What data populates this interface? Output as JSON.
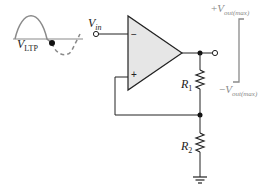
{
  "labels": {
    "vltp": {
      "main": "V",
      "sub": "LTP"
    },
    "vin": {
      "main": "V",
      "sub": "in"
    },
    "r1": {
      "main": "R",
      "sub": "1"
    },
    "r2": {
      "main": "R",
      "sub": "2"
    },
    "vout_max_pos": {
      "sign": "+",
      "main": "V",
      "sub": "out(max)"
    },
    "vout_max_neg": {
      "sign": "−",
      "main": "V",
      "sub": "out(max)"
    }
  },
  "opamp": {
    "inverting": "−",
    "noninverting": "+"
  },
  "colors": {
    "wire": "#222222",
    "opamp_fill": "#e6e6e6",
    "waveform": "#8a8a8a",
    "bracket": "#8a8a8a"
  }
}
